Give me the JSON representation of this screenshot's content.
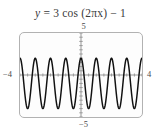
{
  "figure": {
    "equation_text": "y = 3 cos (2πx) − 1",
    "equation_parts": {
      "y": "y",
      "equals": "=",
      "amplitude": "3",
      "function": "cos",
      "argument": "(2πx)",
      "minus": "−",
      "vertical_shift": "1"
    },
    "labels": {
      "y_max": "5",
      "y_min": "−5",
      "x_min": "−4",
      "x_max": "4"
    },
    "colors": {
      "curve": "#111111",
      "axis": "#8a8a8a",
      "frame": "#b2b2b2",
      "text": "#3a3a3a",
      "background": "#fdfdfd"
    }
  },
  "chart_data": {
    "type": "line",
    "xlabel": "",
    "ylabel": "",
    "xlim": [
      -4,
      4
    ],
    "ylim": [
      -5,
      5
    ],
    "grid": false,
    "legend": null,
    "xticks": [
      -4,
      4
    ],
    "yticks": [
      5,
      -5
    ],
    "xtick_labels": [
      "−4",
      "4"
    ],
    "ytick_labels": [
      "5",
      "−5"
    ],
    "axis_tick_marks": {
      "x_axis_interval": 0.5,
      "y_axis_interval": 0.5
    },
    "function": {
      "expression": "3*cos(2*pi*x) - 1",
      "amplitude": 3,
      "period": 1,
      "frequency": 1,
      "angular_frequency": "2π",
      "phase_shift": 0,
      "vertical_shift": -1,
      "max_value": 2,
      "min_value": -4,
      "cycles_shown": 8
    },
    "series": [
      {
        "name": "y = 3 cos (2πx) − 1",
        "color": "#111111",
        "key_points": [
          {
            "x": -4,
            "y": 2
          },
          {
            "x": -3.75,
            "y": -1
          },
          {
            "x": -3.5,
            "y": -4
          },
          {
            "x": -3.25,
            "y": -1
          },
          {
            "x": -3,
            "y": 2
          },
          {
            "x": -2.5,
            "y": -4
          },
          {
            "x": -2,
            "y": 2
          },
          {
            "x": -1.5,
            "y": -4
          },
          {
            "x": -1,
            "y": 2
          },
          {
            "x": -0.5,
            "y": -4
          },
          {
            "x": 0,
            "y": 2
          },
          {
            "x": 0.5,
            "y": -4
          },
          {
            "x": 1,
            "y": 2
          },
          {
            "x": 1.5,
            "y": -4
          },
          {
            "x": 2,
            "y": 2
          },
          {
            "x": 2.5,
            "y": -4
          },
          {
            "x": 3,
            "y": 2
          },
          {
            "x": 3.5,
            "y": -4
          },
          {
            "x": 4,
            "y": 2
          }
        ]
      }
    ]
  }
}
